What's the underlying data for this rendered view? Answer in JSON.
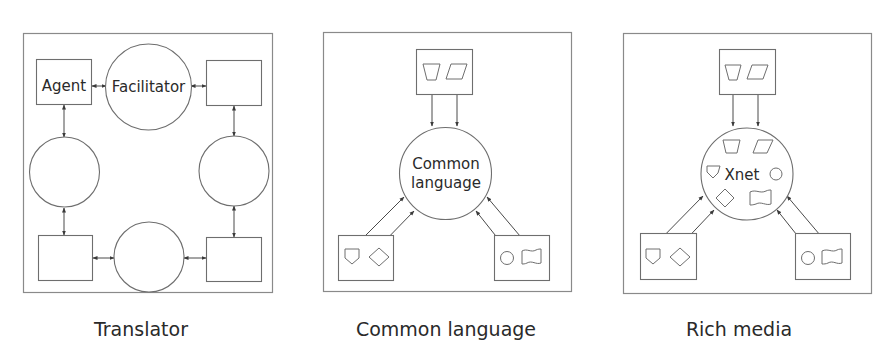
{
  "figure": {
    "panels": [
      {
        "id": "translator",
        "caption": "Translator",
        "nodes": {
          "agent_label": "Agent",
          "facilitator_label": "Facilitator"
        }
      },
      {
        "id": "common-language",
        "caption": "Common language",
        "nodes": {
          "hub_label_line1": "Common",
          "hub_label_line2": "language"
        }
      },
      {
        "id": "rich-media",
        "caption": "Rich media",
        "nodes": {
          "hub_label": "Xnet"
        }
      }
    ],
    "colors": {
      "line": "#6e6e6e",
      "text": "#2a2a2a",
      "background": "#ffffff"
    }
  }
}
